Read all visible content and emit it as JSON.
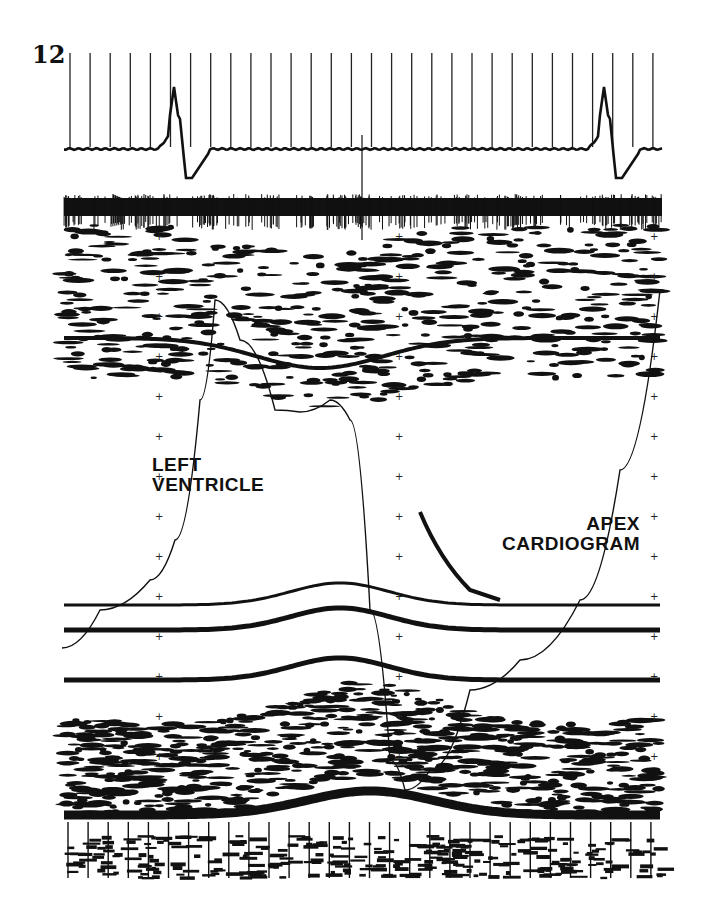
{
  "figure": {
    "number": "12",
    "type": "M-mode echocardiogram with simultaneous ECG and apex cardiogram",
    "colors": {
      "ink": "#111111",
      "paper": "#ffffff"
    }
  },
  "labels": {
    "left_ventricle": [
      "LEFT",
      "VENTRICLE"
    ],
    "apex_cardiogram": [
      "APEX",
      "CARDIOGRAM"
    ]
  },
  "traces": {
    "ecg": {
      "name": "ECG",
      "beats": 2
    },
    "apex_cardiogram": {
      "name": "Apex cardiogram"
    },
    "timing_lines": {
      "count": 30
    }
  }
}
